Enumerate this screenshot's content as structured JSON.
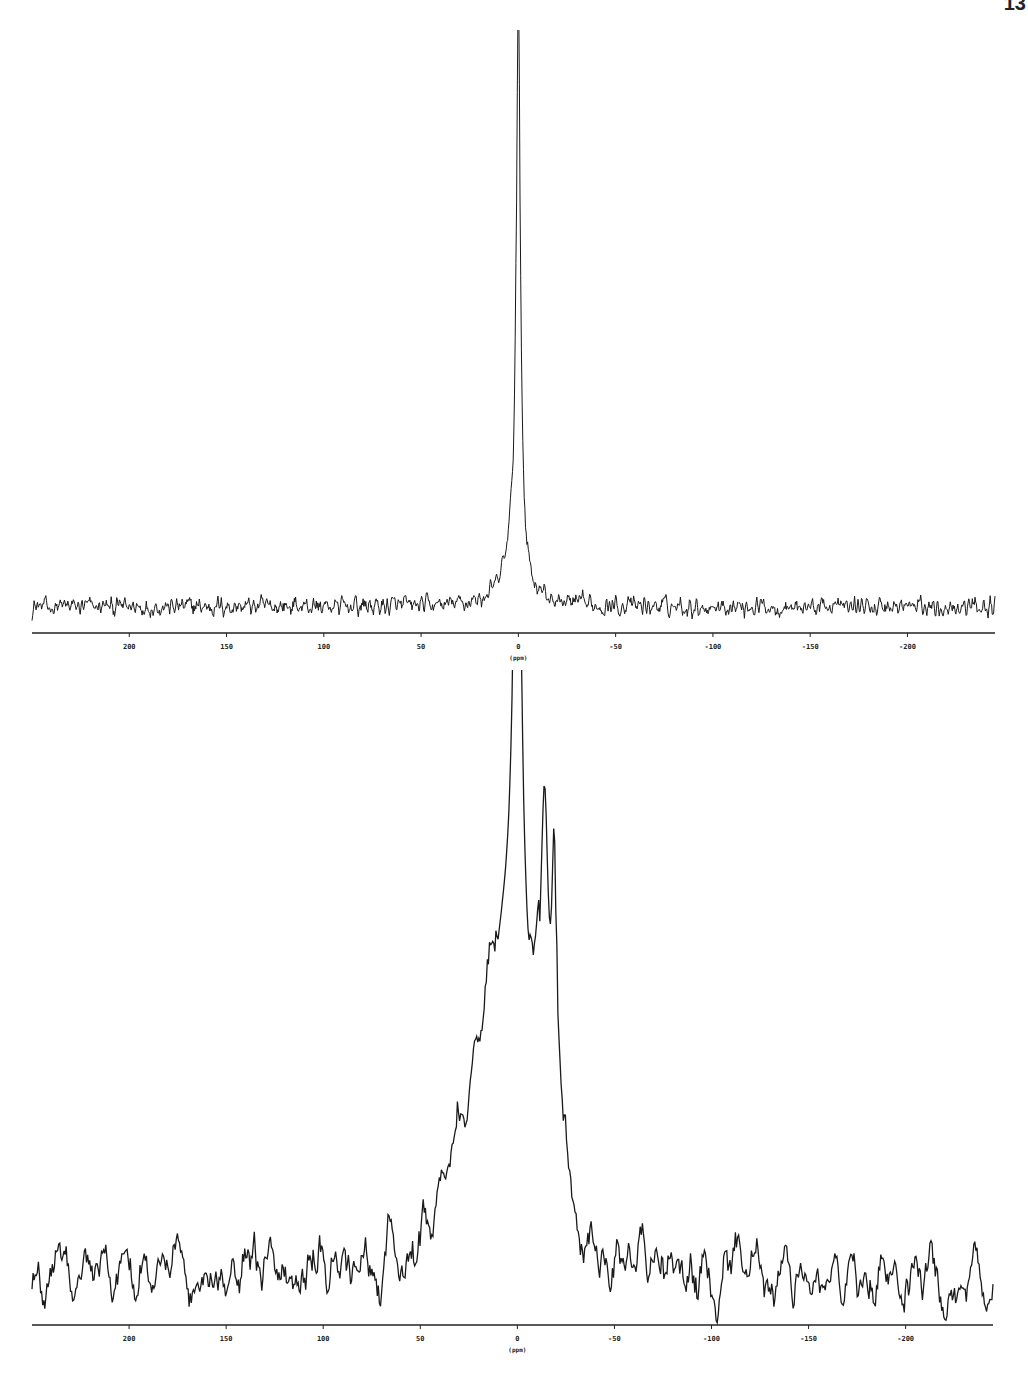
{
  "page": {
    "page_number": "13"
  },
  "chart_data": [
    {
      "type": "line",
      "title": "",
      "xlabel": "(ppm)",
      "ylabel": "",
      "x_reversed": true,
      "xlim": [
        250,
        -245
      ],
      "x_ticks": [
        200,
        150,
        100,
        50,
        0,
        -50,
        -100,
        -150,
        -200
      ],
      "x_tick_labels": [
        "200",
        "150",
        "100",
        "50",
        "0",
        "-50",
        "-100",
        "-150",
        "-200"
      ],
      "grid": false,
      "legend": null,
      "description": "NMR spectrum: single sharp narrow resonance at 0 ppm on a noisy baseline with small broad base from ~+30 to ~-10 ppm",
      "peaks": [
        {
          "position_ppm": 0,
          "relative_height": 1.0,
          "half_width_ppm": 1.2
        },
        {
          "position_ppm": 2,
          "relative_height": 0.1,
          "half_width_ppm": 6
        }
      ],
      "baseline_noise_relative": 0.05,
      "layout": {
        "top": 30,
        "height": 640,
        "baseline_y": 603,
        "peak_top_y": 15,
        "x_left": 32,
        "x_right": 995
      }
    },
    {
      "type": "line",
      "title": "",
      "xlabel": "(ppm)",
      "ylabel": "",
      "x_reversed": true,
      "xlim": [
        250,
        -245
      ],
      "x_ticks": [
        200,
        150,
        100,
        50,
        0,
        -50,
        -100,
        -150,
        -200
      ],
      "x_tick_labels": [
        "200",
        "150",
        "100",
        "50",
        "0",
        "-50",
        "-100",
        "-150",
        "-200"
      ],
      "grid": false,
      "legend": null,
      "description": "NMR spectrum: sharp peak at 0 ppm atop broad hump spanning ~+55 to ~-38 ppm with shoulder peaks near -14 and -19 ppm; noisy baseline",
      "peaks": [
        {
          "position_ppm": 0,
          "relative_height": 1.0,
          "half_width_ppm": 2.2
        },
        {
          "position_ppm": -14,
          "relative_height": 0.5,
          "half_width_ppm": 2.5
        },
        {
          "position_ppm": -19,
          "relative_height": 0.45,
          "half_width_ppm": 1.5
        },
        {
          "position_ppm": 5,
          "relative_height": 0.38,
          "half_width_ppm": 14
        }
      ],
      "broad_hump": {
        "from_ppm": 55,
        "to_ppm": -38,
        "relative_height": 0.27
      },
      "baseline_noise_relative": 0.1,
      "layout": {
        "top": 670,
        "height": 724,
        "baseline_y": 655,
        "peak_top_y": 18,
        "x_left": 32,
        "x_right": 993
      }
    }
  ]
}
